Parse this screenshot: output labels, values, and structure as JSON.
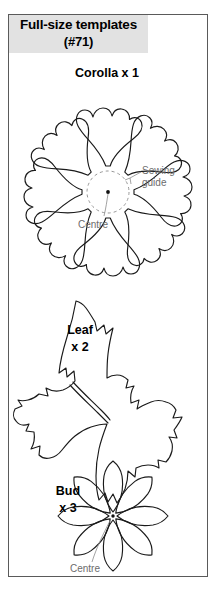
{
  "page": {
    "title_line1": "Full-size templates",
    "title_line2": "(#71)",
    "background_color": "#ffffff",
    "title_band_color": "#e2e2e2",
    "ink_color": "#1a1a1a",
    "callout_color": "#6c6c6c"
  },
  "figures": [
    {
      "id": "corolla",
      "label": "Corolla x 1",
      "petal_count": 8,
      "callouts": [
        {
          "name": "sewing-guide",
          "text_line1": "Sewing",
          "text_line2": "guide"
        },
        {
          "name": "centre",
          "text": "Centre"
        }
      ]
    },
    {
      "id": "leaf",
      "label_line1": "Leaf",
      "label_line2": "x 2",
      "callouts": []
    },
    {
      "id": "bud",
      "label_line1": "Bud",
      "label_line2": "x 3",
      "petal_count": 8,
      "callouts": [
        {
          "name": "centre",
          "text": "Centre"
        }
      ]
    }
  ]
}
